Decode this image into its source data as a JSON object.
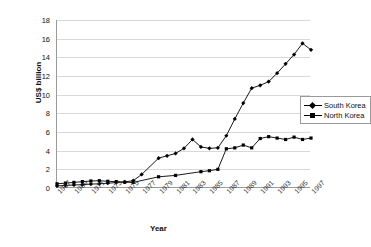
{
  "chart_data": {
    "type": "line",
    "title": "",
    "xlabel": "Year",
    "ylabel": "US$ billion",
    "ylim": [
      0,
      18
    ],
    "ytick_step": 2,
    "yticks": [
      "0",
      "2",
      "4",
      "6",
      "8",
      "10",
      "12",
      "14",
      "16",
      "18"
    ],
    "xlim": [
      1967,
      1997
    ],
    "xticks": [
      "1967",
      "1969",
      "1971",
      "1973",
      "1975",
      "1977",
      "1979",
      "1981",
      "1983",
      "1985",
      "1987",
      "1989",
      "1991",
      "1993",
      "1995",
      "1997"
    ],
    "grid": "horizontal",
    "legend_position": "right",
    "series": [
      {
        "name": "South Korea",
        "marker": "diamond",
        "color": "#000000",
        "x": [
          1967,
          1968,
          1969,
          1970,
          1971,
          1972,
          1973,
          1974,
          1975,
          1976,
          1977,
          1979,
          1980,
          1981,
          1982,
          1983,
          1984,
          1985,
          1986,
          1987,
          1988,
          1989,
          1990,
          1991,
          1992,
          1993,
          1994,
          1995,
          1996,
          1997
        ],
        "values": [
          0.22,
          0.28,
          0.32,
          0.36,
          0.42,
          0.45,
          0.52,
          0.58,
          0.65,
          0.78,
          1.45,
          3.2,
          3.45,
          3.7,
          4.25,
          5.2,
          4.4,
          4.25,
          4.3,
          5.6,
          7.4,
          9.1,
          10.7,
          11.0,
          11.4,
          12.3,
          13.3,
          14.3,
          15.5,
          14.8
        ]
      },
      {
        "name": "North Korea",
        "marker": "square",
        "color": "#000000",
        "x": [
          1967,
          1968,
          1969,
          1970,
          1971,
          1972,
          1973,
          1974,
          1975,
          1976,
          1979,
          1981,
          1984,
          1985,
          1986,
          1987,
          1988,
          1989,
          1990,
          1991,
          1992,
          1993,
          1994,
          1995,
          1996,
          1997
        ],
        "values": [
          0.45,
          0.52,
          0.6,
          0.68,
          0.75,
          0.78,
          0.72,
          0.68,
          0.62,
          0.6,
          1.2,
          1.35,
          1.75,
          1.85,
          2.0,
          4.2,
          4.3,
          4.6,
          4.3,
          5.3,
          5.5,
          5.35,
          5.2,
          5.45,
          5.2,
          5.35
        ]
      }
    ]
  }
}
